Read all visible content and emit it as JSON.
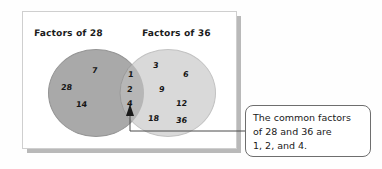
{
  "diagram": {
    "type": "venn-diagram",
    "left_set": {
      "label": "Factors of 28",
      "exclusive_values": [
        "7",
        "28",
        "14"
      ]
    },
    "right_set": {
      "label": "Factors of 36",
      "exclusive_values": [
        "3",
        "6",
        "9",
        "12",
        "18",
        "36"
      ]
    },
    "intersection": {
      "values": [
        "1",
        "2",
        "4"
      ]
    }
  },
  "callout": {
    "lines": [
      "The common factors",
      "of 28 and 36 are",
      "1, 2, and 4."
    ]
  },
  "colors": {
    "left_circle_fill": "#a9a9a9",
    "right_circle_fill": "#d9d9d9",
    "overlap_fill": "#b5b5b5",
    "panel_background": "#ffffff",
    "panel_border": "#cfcfcf",
    "callout_border": "#6e6e6e",
    "text": "#151515"
  }
}
